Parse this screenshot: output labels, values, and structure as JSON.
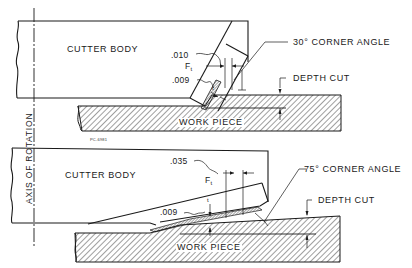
{
  "diagram": {
    "axis_label": "AXIS OF ROTATION",
    "figure_code": "PC-6981",
    "top_view": {
      "cutter_label": "CUTTER BODY",
      "workpiece_label": "WORK PIECE",
      "corner_angle_label": "30° CORNER ANGLE",
      "depth_label": "DEPTH CUT",
      "dim_upper": ".010",
      "dim_lower": ".009",
      "force_label": "F",
      "force_sub": "t",
      "thickness_label": "t"
    },
    "bottom_view": {
      "cutter_label": "CUTTER BODY",
      "workpiece_label": "WORK PIECE",
      "corner_angle_label": "75° CORNER ANGLE",
      "depth_label": "DEPTH CUT",
      "dim_upper": ".035",
      "dim_lower": ".009",
      "force_label": "F",
      "force_sub": "t",
      "thickness_label": "t"
    },
    "colors": {
      "line": "#1a1a1a",
      "background": "#ffffff",
      "hatch": "#2a2a2a"
    }
  }
}
